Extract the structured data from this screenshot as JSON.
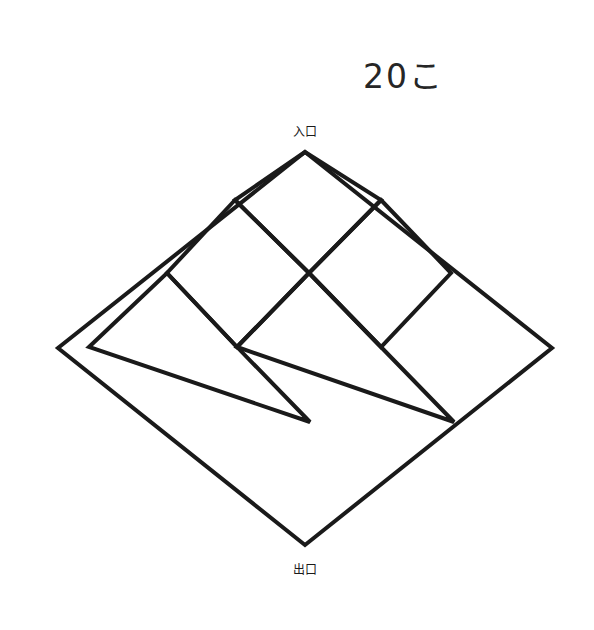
{
  "figure": {
    "title_text": "20こ",
    "entrance_label": "入口",
    "exit_label": "出口",
    "ball_count": 20,
    "ball_count_unit": "こ",
    "outline_color": "#1a1a1a",
    "arrow_color": "#3f6fbf",
    "node_stroke_color": "#1a1a1a",
    "background_color": "#ffffff"
  },
  "balls": {
    "name": "ball-cluster",
    "total": 20,
    "radius": 6,
    "rows": [
      {
        "cy": 44,
        "cxs": [
          276,
          296,
          316
        ]
      },
      {
        "cy": 63,
        "cxs": [
          258,
          278,
          298,
          318,
          334
        ]
      },
      {
        "cy": 81,
        "cxs": [
          252,
          272,
          292,
          312,
          332
        ]
      },
      {
        "cy": 98,
        "cxs": [
          262,
          284,
          306,
          328
        ]
      },
      {
        "cy": 112,
        "cxs": [
          288,
          308,
          328
        ]
      }
    ]
  },
  "lattice": {
    "apex_top": {
      "x": 305,
      "y": 152
    },
    "apex_bottom": {
      "x": 305,
      "y": 545
    },
    "left_corner": {
      "x": 58,
      "y": 348
    },
    "right_corner": {
      "x": 552,
      "y": 348
    },
    "node_radius": 16,
    "nodes": [
      {
        "id": "a",
        "label": "あ",
        "x": 235,
        "y": 200,
        "row": 1,
        "col": 0
      },
      {
        "id": "i",
        "label": "い",
        "x": 381,
        "y": 200,
        "row": 1,
        "col": 1
      },
      {
        "id": "u",
        "label": "う",
        "x": 167,
        "y": 273,
        "row": 2,
        "col": 0
      },
      {
        "id": "e",
        "label": "え",
        "x": 309,
        "y": 273,
        "row": 2,
        "col": 1
      },
      {
        "id": "o",
        "label": "お",
        "x": 451,
        "y": 273,
        "row": 2,
        "col": 2
      },
      {
        "id": "ka",
        "label": "か",
        "x": 89,
        "y": 347,
        "row": 3,
        "col": 0
      },
      {
        "id": "ki",
        "label": "き",
        "x": 237,
        "y": 347,
        "row": 3,
        "col": 1
      },
      {
        "id": "ku",
        "label": "く",
        "x": 381,
        "y": 347,
        "row": 3,
        "col": 2
      },
      {
        "id": "ke",
        "label": "け",
        "x": 524,
        "y": 347,
        "row": 3,
        "col": 3
      },
      {
        "id": "ko",
        "label": "こ",
        "x": 164,
        "y": 422,
        "row": 4,
        "col": 0
      },
      {
        "id": "sa",
        "label": "さ",
        "x": 310,
        "y": 422,
        "row": 4,
        "col": 1
      },
      {
        "id": "si",
        "label": "し",
        "x": 454,
        "y": 422,
        "row": 4,
        "col": 2
      },
      {
        "id": "su",
        "label": "す",
        "x": 234,
        "y": 498,
        "row": 5,
        "col": 0
      },
      {
        "id": "se",
        "label": "せ",
        "x": 379,
        "y": 498,
        "row": 5,
        "col": 1
      }
    ],
    "edges": [
      {
        "from": "entrance",
        "to": "a"
      },
      {
        "from": "entrance",
        "to": "i"
      },
      {
        "from": "a",
        "to": "u"
      },
      {
        "from": "a",
        "to": "e"
      },
      {
        "from": "i",
        "to": "e"
      },
      {
        "from": "i",
        "to": "o"
      },
      {
        "from": "u",
        "to": "ka"
      },
      {
        "from": "u",
        "to": "ki"
      },
      {
        "from": "e",
        "to": "ki"
      },
      {
        "from": "e",
        "to": "ku"
      },
      {
        "from": "o",
        "to": "ku"
      },
      {
        "from": "o",
        "to": "ke"
      },
      {
        "from": "ka",
        "to": "ko"
      },
      {
        "from": "ki",
        "to": "ko"
      },
      {
        "from": "ki",
        "to": "sa"
      },
      {
        "from": "ku",
        "to": "sa"
      },
      {
        "from": "ku",
        "to": "si"
      },
      {
        "from": "ke",
        "to": "si"
      },
      {
        "from": "ko",
        "to": "su"
      },
      {
        "from": "sa",
        "to": "su"
      },
      {
        "from": "sa",
        "to": "se"
      },
      {
        "from": "si",
        "to": "se"
      },
      {
        "from": "su",
        "to": "exit"
      },
      {
        "from": "se",
        "to": "exit"
      }
    ]
  },
  "chart_data": {
    "type": "diagram",
    "title": "20こ",
    "description_nodes": [
      "あ",
      "い",
      "う",
      "え",
      "お",
      "か",
      "き",
      "く",
      "け",
      "こ",
      "さ",
      "し",
      "す",
      "せ"
    ],
    "entry": "入口",
    "exit": "出口",
    "ball_total": 20
  }
}
